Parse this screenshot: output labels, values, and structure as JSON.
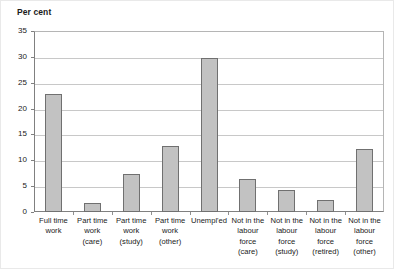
{
  "chart_data": {
    "type": "bar",
    "title": "",
    "subtitle": "",
    "xlabel": "",
    "ylabel": "Per cent",
    "ylim": [
      0,
      35
    ],
    "yticks": [
      0,
      5,
      10,
      15,
      20,
      25,
      30,
      35
    ],
    "ytick_labels": [
      "0",
      "5",
      "10",
      "15",
      "20",
      "25",
      "30",
      "35"
    ],
    "grid": true,
    "legend": "none",
    "categories": [
      "Full time\nwork",
      "Part time\nwork\n(care)",
      "Part time\nwork\n(study)",
      "Part time\nwork\n(other)",
      "Unempl'ed",
      "Not in the\nlabour\nforce\n(care)",
      "Not in the\nlabour\nforce\n(study)",
      "Not in the\nlabour\nforce\n(retired)",
      "Not in the\nlabour\nforce\n(other)"
    ],
    "values": [
      22.8,
      1.7,
      7.4,
      12.7,
      29.8,
      6.4,
      4.2,
      2.3,
      12.2
    ],
    "colors": {
      "bar_fill": "#c2c2c2",
      "bar_edge": "#707070",
      "grid": "#c8c8c8",
      "axis": "#808080",
      "text": "#1a1a1a"
    }
  }
}
